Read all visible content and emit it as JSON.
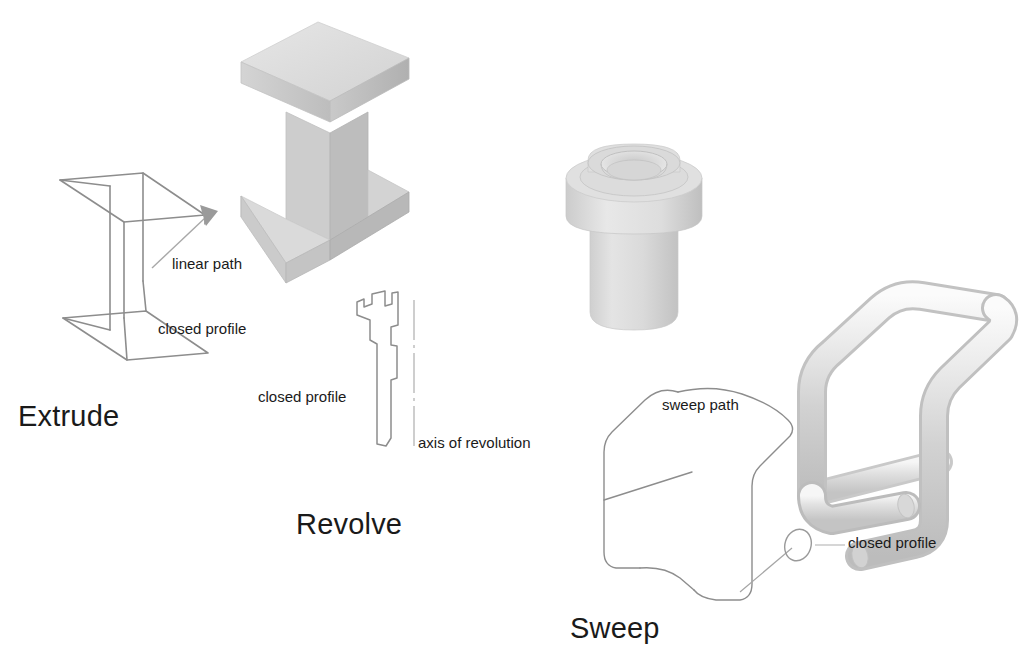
{
  "page": {
    "background_color": "#ffffff",
    "width": 1036,
    "height": 658,
    "kind": "cad-feature-operations-diagram"
  },
  "operations": [
    {
      "id": "extrude",
      "title": "Extrude",
      "annotations": [
        {
          "id": "linear-path",
          "label": "linear path"
        },
        {
          "id": "closed-profile",
          "label": "closed profile"
        }
      ],
      "profile_shape": "i-beam-section",
      "solid_shape": "extruded-i-beam"
    },
    {
      "id": "revolve",
      "title": "Revolve",
      "annotations": [
        {
          "id": "closed-profile",
          "label": "closed profile"
        },
        {
          "id": "axis-of-revolution",
          "label": "axis of revolution"
        }
      ],
      "profile_shape": "stepped-bushing-half-section",
      "solid_shape": "revolved-flanged-bushing"
    },
    {
      "id": "sweep",
      "title": "Sweep",
      "annotations": [
        {
          "id": "sweep-path",
          "label": "sweep path"
        },
        {
          "id": "closed-profile",
          "label": "closed profile"
        }
      ],
      "profile_shape": "small-circle",
      "solid_shape": "swept-bent-tube"
    }
  ],
  "colors": {
    "line": "#8d8d8d",
    "text": "#1a1a1a",
    "solid_light": "#dcdcdc",
    "solid_mid": "#c6c6c6",
    "solid_dark": "#b3b3b3",
    "solid_highlight": "#ededed",
    "arrow_fill": "#9a9a9a",
    "axis_line": "#b0b0b0"
  }
}
